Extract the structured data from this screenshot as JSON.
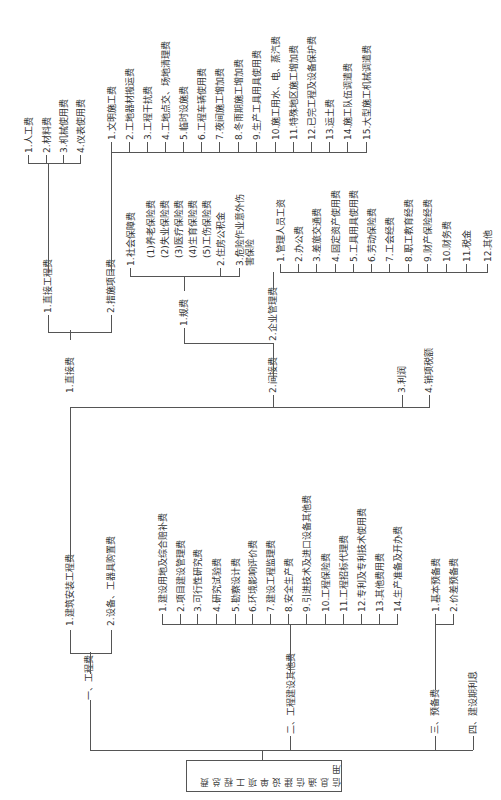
{
  "diagram": {
    "type": "tree",
    "orientation": "rotated-90-ccw",
    "root": "信息通信建设单项工程总费用",
    "level1": [
      {
        "label": "一、工程费"
      },
      {
        "label": "二、工程建设其他费"
      },
      {
        "label": "三、预备费"
      },
      {
        "label": "四、建设期利息"
      }
    ],
    "engineering_fee": {
      "children": [
        {
          "label": "1.建筑安装工程费"
        },
        {
          "label": "2.设备、工器具购置费"
        }
      ]
    },
    "construction_install": {
      "children": [
        {
          "label": "1.直接费"
        },
        {
          "label": "2.间接费"
        },
        {
          "label": "3.利润"
        },
        {
          "label": "4.销项税额"
        }
      ]
    },
    "direct_fee": {
      "children": [
        {
          "label": "1.直接工程费"
        },
        {
          "label": "2.措施项目费"
        }
      ]
    },
    "direct_engineering": {
      "children": [
        {
          "label": "1.人工费"
        },
        {
          "label": "2.材料费"
        },
        {
          "label": "3.机械使用费"
        },
        {
          "label": "4.仪表使用费"
        }
      ]
    },
    "measures": {
      "children": [
        {
          "label": "1.文明施工费"
        },
        {
          "label": "2.工地器材搬运费"
        },
        {
          "label": "3.工程干扰费"
        },
        {
          "label": "4.工地点交、场地清理费"
        },
        {
          "label": "5.临时设施费"
        },
        {
          "label": "6.工程车辆使用费"
        },
        {
          "label": "7.夜间施工增加费"
        },
        {
          "label": "8.冬雨期施工增加费"
        },
        {
          "label": "9.生产工具用具使用费"
        },
        {
          "label": "10.施工用水、电、蒸汽费"
        },
        {
          "label": "11.特殊地区施工增加费"
        },
        {
          "label": "12.已完工程及设备保护费"
        },
        {
          "label": "13.运土费"
        },
        {
          "label": "14.施工队伍调遣费"
        },
        {
          "label": "15.大型施工机械调遣费"
        }
      ]
    },
    "indirect_fee": {
      "children": [
        {
          "label": "1.规费"
        },
        {
          "label": "2.企业管理费"
        }
      ]
    },
    "regulatory_fees": {
      "children": [
        {
          "label": "1.社会保障费"
        },
        {
          "label": "(1)养老保险费"
        },
        {
          "label": "(2)失业保险费"
        },
        {
          "label": "(3)医疗保险费"
        },
        {
          "label": "(4)生育保险费"
        },
        {
          "label": "(5)工伤保险费"
        },
        {
          "label": "2.住房公积金"
        },
        {
          "label": "3.危险作业意外伤害保险"
        }
      ]
    },
    "enterprise_mgmt": {
      "children": [
        {
          "label": "1.管理人员工资"
        },
        {
          "label": "2.办公费"
        },
        {
          "label": "3.差旅交通费"
        },
        {
          "label": "4.固定资产使用费"
        },
        {
          "label": "5.工具用具使用费"
        },
        {
          "label": "6.劳动保险费"
        },
        {
          "label": "7.工会经费"
        },
        {
          "label": "8.职工教育经费"
        },
        {
          "label": "9.财产保险经费"
        },
        {
          "label": "10.财务费"
        },
        {
          "label": "11.税金"
        },
        {
          "label": "12.其他"
        }
      ]
    },
    "other_construction": {
      "children": [
        {
          "label": "1.建设用地及综合赔补费"
        },
        {
          "label": "2.项目建设管理费"
        },
        {
          "label": "3.可行性研究费"
        },
        {
          "label": "4.研究试验费"
        },
        {
          "label": "5.勘察设计费"
        },
        {
          "label": "6.环境影响评价费"
        },
        {
          "label": "7.建设工程监理费"
        },
        {
          "label": "8.安全生产费"
        },
        {
          "label": "9.引进技术及进口设备其他费"
        },
        {
          "label": "10.工程保险费"
        },
        {
          "label": "11.工程招标代理费"
        },
        {
          "label": "12.专利及专利技术使用费"
        },
        {
          "label": "13.其他费用费"
        },
        {
          "label": "14.生产准备及开办费"
        }
      ]
    },
    "reserve": {
      "children": [
        {
          "label": "1.基本预备费"
        },
        {
          "label": "2.价差预备费"
        }
      ]
    }
  }
}
